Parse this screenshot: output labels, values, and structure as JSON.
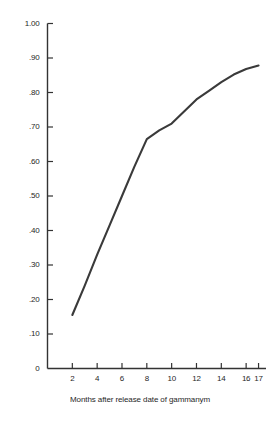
{
  "chart_data": {
    "type": "line",
    "title": "",
    "subtitle": "",
    "xlabel": "Months after release date of gammanym",
    "ylabel": "",
    "xlim": [
      0,
      17.6
    ],
    "ylim": [
      0,
      1.0
    ],
    "grid": false,
    "legend": null,
    "line_color": "#3a3a3a",
    "axis_color": "#333333",
    "x_ticks": [
      2,
      4,
      6,
      8,
      10,
      12,
      14,
      16,
      17
    ],
    "x_tick_labels": [
      "2",
      "4",
      "6",
      "8",
      "10",
      "12",
      "14",
      "16",
      "17"
    ],
    "y_ticks": [
      0,
      0.1,
      0.2,
      0.3,
      0.4,
      0.5,
      0.6,
      0.7,
      0.8,
      0.9,
      1.0
    ],
    "y_tick_labels": [
      "0",
      ".10",
      ".20",
      ".30",
      ".40",
      ".50",
      ".60",
      ".70",
      ".80",
      ".90",
      "1.00"
    ],
    "x": [
      2,
      3,
      4,
      5,
      6,
      7,
      8,
      9,
      10,
      11,
      12,
      13,
      14,
      15,
      16,
      17
    ],
    "values": [
      0.155,
      0.24,
      0.33,
      0.415,
      0.5,
      0.585,
      0.665,
      0.69,
      0.71,
      0.745,
      0.78,
      0.805,
      0.83,
      0.852,
      0.868,
      0.878
    ],
    "series": [
      {
        "name": "cumulative proportion",
        "x": [
          2,
          3,
          4,
          5,
          6,
          7,
          8,
          9,
          10,
          11,
          12,
          13,
          14,
          15,
          16,
          17
        ],
        "values": [
          0.155,
          0.24,
          0.33,
          0.415,
          0.5,
          0.585,
          0.665,
          0.69,
          0.71,
          0.745,
          0.78,
          0.805,
          0.83,
          0.852,
          0.868,
          0.878
        ]
      }
    ],
    "annotations": []
  },
  "axis_titles": {
    "x": "Months after release date of gammanym"
  }
}
